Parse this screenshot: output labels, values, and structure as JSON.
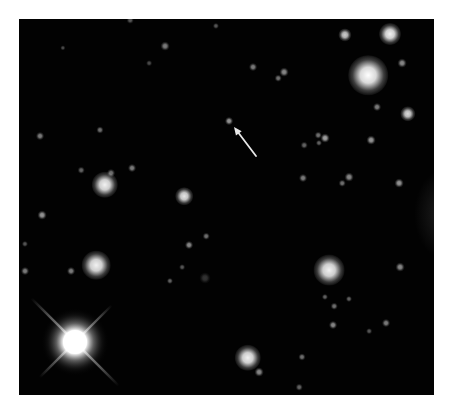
{
  "image": {
    "description": "Telescope starfield with an arrow pointing to a faint object",
    "frame": {
      "x": 19,
      "y": 19,
      "width": 415,
      "height": 376
    },
    "background_color": "#020202",
    "page_color": "#ffffff"
  },
  "bright_star": {
    "x": 75,
    "y": 342,
    "core_radius": 16,
    "halo_radius": 34,
    "spikes": [
      {
        "angle": 45,
        "length_a": 62,
        "length_b": 62
      },
      {
        "angle": -45,
        "length_a": 50,
        "length_b": 52
      }
    ],
    "color": "#ffffff"
  },
  "arrow": {
    "tip": {
      "x": 234,
      "y": 127
    },
    "tail": {
      "x": 256,
      "y": 156
    },
    "color": "#e8e8e8",
    "target": {
      "x": 229,
      "y": 121
    }
  },
  "stars": [
    {
      "x": 368,
      "y": 75,
      "r": 9,
      "b": 1.0
    },
    {
      "x": 390,
      "y": 34,
      "r": 5,
      "b": 0.95
    },
    {
      "x": 345,
      "y": 35,
      "r": 3,
      "b": 0.8
    },
    {
      "x": 408,
      "y": 114,
      "r": 3.5,
      "b": 0.85
    },
    {
      "x": 402,
      "y": 63,
      "r": 2,
      "b": 0.55
    },
    {
      "x": 377,
      "y": 107,
      "r": 1.8,
      "b": 0.5
    },
    {
      "x": 105,
      "y": 185,
      "r": 6,
      "b": 0.95
    },
    {
      "x": 184,
      "y": 196,
      "r": 4,
      "b": 0.9
    },
    {
      "x": 132,
      "y": 168,
      "r": 1.8,
      "b": 0.5
    },
    {
      "x": 111,
      "y": 173,
      "r": 1.8,
      "b": 0.45
    },
    {
      "x": 96,
      "y": 265,
      "r": 6.5,
      "b": 0.95
    },
    {
      "x": 329,
      "y": 270,
      "r": 7,
      "b": 0.95
    },
    {
      "x": 248,
      "y": 358,
      "r": 6,
      "b": 0.95
    },
    {
      "x": 259,
      "y": 372,
      "r": 2,
      "b": 0.55
    },
    {
      "x": 229,
      "y": 121,
      "r": 1.8,
      "b": 0.6
    },
    {
      "x": 399,
      "y": 183,
      "r": 2,
      "b": 0.6
    },
    {
      "x": 400,
      "y": 267,
      "r": 2,
      "b": 0.55
    },
    {
      "x": 40,
      "y": 136,
      "r": 1.8,
      "b": 0.5
    },
    {
      "x": 100,
      "y": 130,
      "r": 1.6,
      "b": 0.45
    },
    {
      "x": 42,
      "y": 215,
      "r": 2,
      "b": 0.6
    },
    {
      "x": 81,
      "y": 170,
      "r": 1.5,
      "b": 0.4
    },
    {
      "x": 325,
      "y": 138,
      "r": 2,
      "b": 0.65
    },
    {
      "x": 318,
      "y": 135,
      "r": 1.5,
      "b": 0.45
    },
    {
      "x": 319,
      "y": 143,
      "r": 1.4,
      "b": 0.4
    },
    {
      "x": 371,
      "y": 140,
      "r": 2,
      "b": 0.6
    },
    {
      "x": 304,
      "y": 145,
      "r": 1.5,
      "b": 0.4
    },
    {
      "x": 303,
      "y": 178,
      "r": 1.8,
      "b": 0.5
    },
    {
      "x": 349,
      "y": 177,
      "r": 2,
      "b": 0.55
    },
    {
      "x": 342,
      "y": 183,
      "r": 1.5,
      "b": 0.45
    },
    {
      "x": 165,
      "y": 46,
      "r": 2,
      "b": 0.5
    },
    {
      "x": 253,
      "y": 67,
      "r": 1.8,
      "b": 0.5
    },
    {
      "x": 284,
      "y": 72,
      "r": 2,
      "b": 0.55
    },
    {
      "x": 278,
      "y": 78,
      "r": 1.5,
      "b": 0.45
    },
    {
      "x": 216,
      "y": 26,
      "r": 1.4,
      "b": 0.35
    },
    {
      "x": 189,
      "y": 245,
      "r": 1.8,
      "b": 0.55
    },
    {
      "x": 206,
      "y": 236,
      "r": 1.5,
      "b": 0.45
    },
    {
      "x": 170,
      "y": 281,
      "r": 1.4,
      "b": 0.4
    },
    {
      "x": 182,
      "y": 267,
      "r": 1.3,
      "b": 0.35
    },
    {
      "x": 205,
      "y": 278,
      "r": 2.5,
      "b": 0.2
    },
    {
      "x": 325,
      "y": 297,
      "r": 1.4,
      "b": 0.4
    },
    {
      "x": 334,
      "y": 306,
      "r": 1.5,
      "b": 0.45
    },
    {
      "x": 349,
      "y": 299,
      "r": 1.4,
      "b": 0.4
    },
    {
      "x": 333,
      "y": 325,
      "r": 1.8,
      "b": 0.55
    },
    {
      "x": 386,
      "y": 323,
      "r": 1.8,
      "b": 0.5
    },
    {
      "x": 369,
      "y": 331,
      "r": 1.3,
      "b": 0.35
    },
    {
      "x": 302,
      "y": 357,
      "r": 1.6,
      "b": 0.45
    },
    {
      "x": 299,
      "y": 387,
      "r": 1.5,
      "b": 0.4
    },
    {
      "x": 25,
      "y": 271,
      "r": 1.8,
      "b": 0.5
    },
    {
      "x": 25,
      "y": 244,
      "r": 1.4,
      "b": 0.35
    },
    {
      "x": 71,
      "y": 271,
      "r": 1.8,
      "b": 0.5
    },
    {
      "x": 149,
      "y": 63,
      "r": 1.3,
      "b": 0.3
    },
    {
      "x": 63,
      "y": 48,
      "r": 1.2,
      "b": 0.3
    },
    {
      "x": 130,
      "y": 20,
      "r": 1.5,
      "b": 0.35
    }
  ]
}
